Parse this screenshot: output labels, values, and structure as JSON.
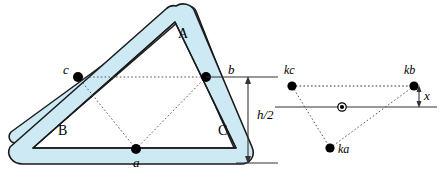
{
  "figure": {
    "colors": {
      "frame_fill": "#cdeaf4",
      "frame_stroke": "#1b1b1b",
      "point_fill": "#000000",
      "dotted_line": "#555555",
      "dimension_line": "#333333",
      "background": "#ffffff"
    }
  },
  "left_diagram": {
    "name": "triangle-frame",
    "vertex_labels": [
      {
        "id": "A",
        "text": "A",
        "x": 178,
        "y": 34,
        "style": "upright"
      },
      {
        "id": "B",
        "text": "B",
        "x": 58,
        "y": 131,
        "style": "upright"
      },
      {
        "id": "C",
        "text": "C",
        "x": 218,
        "y": 131,
        "style": "upright"
      }
    ],
    "midpoint_labels": [
      {
        "id": "a",
        "text": "a",
        "x": 135,
        "y": 163,
        "style": "italic"
      },
      {
        "id": "b",
        "text": "b",
        "x": 228,
        "y": 70,
        "style": "italic"
      },
      {
        "id": "c",
        "text": "c",
        "x": 64,
        "y": 70,
        "style": "italic"
      }
    ],
    "midpoints": [
      {
        "id": "a",
        "x": 136,
        "y": 149
      },
      {
        "id": "b",
        "x": 206,
        "y": 77
      },
      {
        "id": "c",
        "x": 78,
        "y": 77
      }
    ]
  },
  "dimension": {
    "name": "half-height-dimension",
    "label": "h/2",
    "label_x": 259,
    "label_y": 108,
    "top_y": 77,
    "bottom_y": 149,
    "arrow_x": 248
  },
  "right_diagram": {
    "name": "point-mass-diagram",
    "points": [
      {
        "id": "kc",
        "label": "kc",
        "x": 292,
        "y": 86,
        "label_x": 285,
        "label_y": 70
      },
      {
        "id": "kb",
        "label": "kb",
        "x": 414,
        "y": 86,
        "label_x": 402,
        "label_y": 70
      },
      {
        "id": "ka",
        "label": "ka",
        "x": 330,
        "y": 148,
        "label_x": 338,
        "label_y": 155
      }
    ],
    "centroid": {
      "id": "centroid",
      "x": 342,
      "y": 107
    },
    "offset_label": {
      "text": "x",
      "x": 423,
      "y": 96
    },
    "baseline": {
      "x1": 275,
      "x2": 437,
      "y": 107
    }
  }
}
